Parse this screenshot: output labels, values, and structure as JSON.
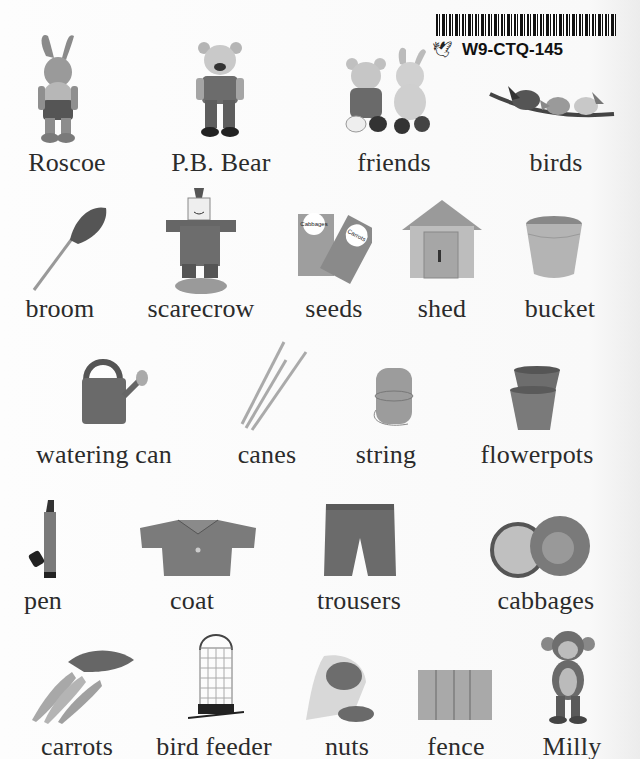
{
  "sticker": {
    "code": "W9-CTQ-145",
    "mark_icon": "scribble-bird-icon"
  },
  "rows": [
    {
      "items": [
        {
          "label": "Roscoe",
          "icon": "rabbit-toy-icon"
        },
        {
          "label": "P.B. Bear",
          "icon": "teddy-bear-icon"
        },
        {
          "label": "friends",
          "icon": "bear-and-rabbit-icon"
        },
        {
          "label": "birds",
          "icon": "birds-on-branch-icon"
        }
      ]
    },
    {
      "items": [
        {
          "label": "broom",
          "icon": "broom-icon"
        },
        {
          "label": "scarecrow",
          "icon": "scarecrow-icon"
        },
        {
          "label": "seeds",
          "icon": "seed-packets-icon",
          "packet_texts": [
            "Cabbages",
            "Carrots"
          ]
        },
        {
          "label": "shed",
          "icon": "shed-icon"
        },
        {
          "label": "bucket",
          "icon": "bucket-icon"
        }
      ]
    },
    {
      "items": [
        {
          "label": "watering can",
          "icon": "watering-can-icon"
        },
        {
          "label": "canes",
          "icon": "canes-icon"
        },
        {
          "label": "string",
          "icon": "string-ball-icon"
        },
        {
          "label": "flowerpots",
          "icon": "flowerpots-icon"
        }
      ]
    },
    {
      "items": [
        {
          "label": "pen",
          "icon": "pen-icon"
        },
        {
          "label": "coat",
          "icon": "coat-icon"
        },
        {
          "label": "trousers",
          "icon": "trousers-icon"
        },
        {
          "label": "cabbages",
          "icon": "cabbages-icon"
        }
      ]
    },
    {
      "items": [
        {
          "label": "carrots",
          "icon": "carrots-icon"
        },
        {
          "label": "bird feeder",
          "icon": "bird-feeder-icon"
        },
        {
          "label": "nuts",
          "icon": "nuts-bag-icon"
        },
        {
          "label": "fence",
          "icon": "fence-icon"
        },
        {
          "label": "Milly",
          "icon": "monkey-toy-icon"
        }
      ]
    }
  ]
}
